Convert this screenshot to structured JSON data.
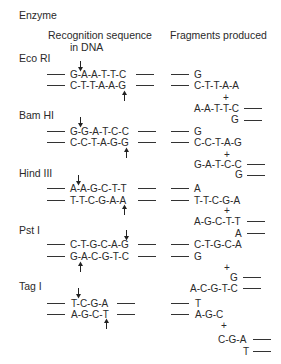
{
  "header": {
    "enzyme_label": "Enzyme",
    "col1_line1": "Recognition sequence",
    "col1_line2": "in DNA",
    "col2": "Fragments produced"
  },
  "enzymes": [
    {
      "name": "Eco RI",
      "top": "G-A-A-T-T-C",
      "bottom": "C-T-T-A-A-G",
      "frag1_top": "G",
      "frag1_bottom": "C-T-T-A-A",
      "plus": "+",
      "frag2_top": "A-A-T-T-C",
      "frag2_bottom": "G"
    },
    {
      "name": "Bam HI",
      "top": "G-G-A-T-C-C",
      "bottom": "C-C-T-A-G-G",
      "frag1_top": "G",
      "frag1_bottom": "C-C-T-A-G",
      "plus": "+",
      "frag2_top": "G-A-T-C-C",
      "frag2_bottom": "G"
    },
    {
      "name": "Hind III",
      "top": "A-A-G-C-T-T",
      "bottom": "T-T-C-G-A-A",
      "frag1_top": "A",
      "frag1_bottom": "T-T-C-G-A",
      "plus": "+",
      "frag2_top": "A-G-C-T-T",
      "frag2_bottom": "A"
    },
    {
      "name": "Pst I",
      "top": "C-T-G-C-A-G",
      "bottom": "G-A-C-G-T-C",
      "frag1_top": "C-T-G-C-A",
      "frag1_bottom": "G",
      "plus": "+",
      "frag2_top": "G",
      "frag2_bottom": "A-C-G-T-C"
    },
    {
      "name": "Tag I",
      "top": "T-C-G-A",
      "bottom": "A-G-C-T",
      "frag1_top": "T",
      "frag1_bottom": "A-G-C",
      "plus": "+",
      "frag2_top": "C-G-A",
      "frag2_bottom": "T"
    }
  ],
  "icons": {
    "cut_down": "arrow-down",
    "cut_up": "arrow-up"
  }
}
